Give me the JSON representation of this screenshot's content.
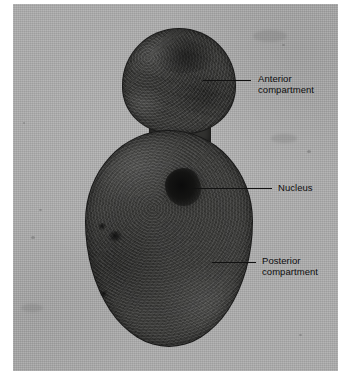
{
  "figure": {
    "type": "light-micrograph",
    "page_background": "#ffffff",
    "plate_background": "#adadad",
    "cell_color": "#3a3a38",
    "label_color": "#0d0d0d"
  },
  "labels": [
    {
      "id": "anterior",
      "name": "anterior-compartment",
      "lines": [
        "Anterior",
        "compartment"
      ],
      "text": "Anterior compartment"
    },
    {
      "id": "nucleus",
      "name": "nucleus",
      "lines": [
        "Nucleus"
      ],
      "text": "Nucleus"
    },
    {
      "id": "posterior",
      "name": "posterior-compartment",
      "lines": [
        "Posterior",
        "compartment"
      ],
      "text": "Posterior compartment"
    }
  ]
}
